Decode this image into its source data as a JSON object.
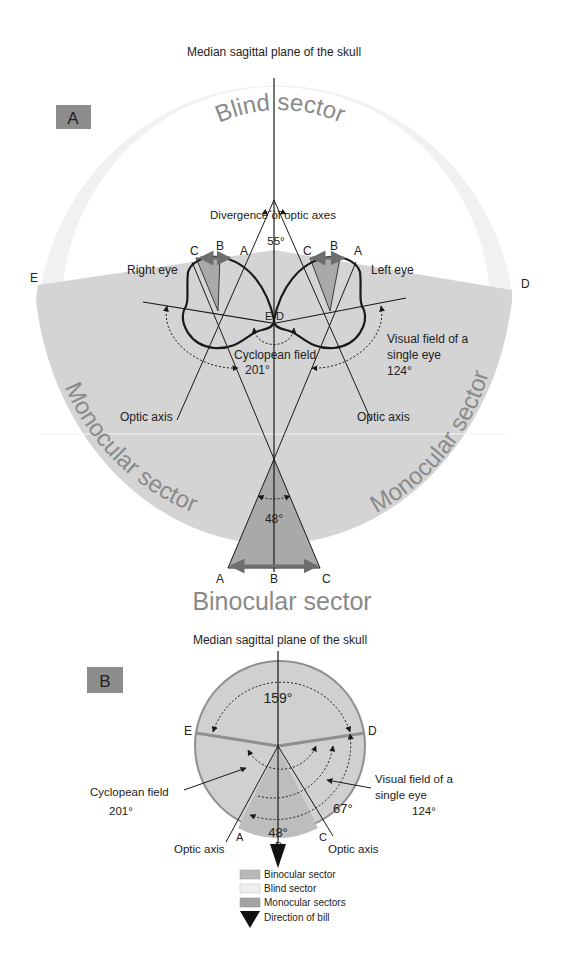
{
  "colors": {
    "blind": "#f1f1f1",
    "monocular": "#d4d4d4",
    "binocular": "#a9a9a9",
    "panel_badge": "#8c8c8c",
    "line": "#1a1a1a",
    "arrow_gray": "#6e6e6e"
  },
  "panel_a": {
    "badge": "A",
    "title": "Median sagittal plane of the skull",
    "blind_sector": "Blind sector",
    "binocular_sector": "Binocular sector",
    "monocular_left": "Monocular sector",
    "monocular_right": "Monocular sector",
    "divergence_label": "Divergence of optic axes",
    "divergence_angle": "55°",
    "right_eye": "Right eye",
    "left_eye": "Left eye",
    "cyclopean_label": "Cyclopean field",
    "cyclopean_angle": "201°",
    "visual_field_line1": "Visual field of a",
    "visual_field_line2": "single eye",
    "visual_field_angle": "124°",
    "optic_axis_left": "Optic axis",
    "optic_axis_right": "Optic axis",
    "binocular_angle": "48°",
    "points": {
      "E": "E",
      "D": "D",
      "eye_r_C": "C",
      "eye_r_B": "B",
      "eye_r_A": "A",
      "eye_l_C": "C",
      "eye_l_B": "B",
      "eye_l_A": "A",
      "center_E": "E",
      "center_D": "D",
      "bottom_A": "A",
      "bottom_B": "B",
      "bottom_C": "C"
    }
  },
  "panel_b": {
    "badge": "B",
    "title": "Median sagittal plane of the skull",
    "blind_angle": "159°",
    "cyclopean_label": "Cyclopean field",
    "cyclopean_angle": "201°",
    "visual_field_line1": "Visual field of a",
    "visual_field_line2": "single eye",
    "visual_field_angle": "124°",
    "monocular_angle": "67°",
    "binocular_angle": "48°",
    "optic_axis_left": "Optic axis",
    "optic_axis_right": "Optic axis",
    "points": {
      "E": "E",
      "D": "D",
      "A": "A",
      "B": "B",
      "C": "C"
    }
  },
  "legend": [
    {
      "label": "Binocular sector",
      "swatch": "#b9b9b9"
    },
    {
      "label": "Blind sector",
      "swatch": "#efefef"
    },
    {
      "label": "Monocular sectors",
      "swatch": "#a3a3a3"
    },
    {
      "label": "Direction of bill",
      "swatch": "arrow"
    }
  ]
}
